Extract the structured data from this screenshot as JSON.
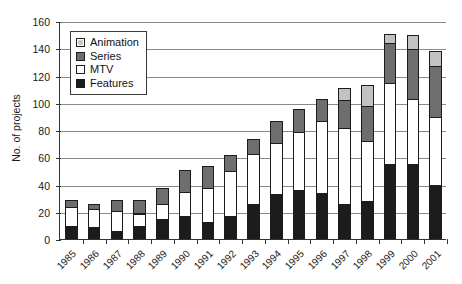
{
  "chart_data": {
    "type": "bar",
    "stacked": true,
    "title": "",
    "subtitle": "",
    "xlabel": "",
    "ylabel": "No. of projects",
    "ylim": [
      0,
      160
    ],
    "ytick_step": 20,
    "yticks": [
      0,
      20,
      40,
      60,
      80,
      100,
      120,
      140,
      160
    ],
    "grid": "horizontal",
    "legend_position": "top-left-inside",
    "categories": [
      "1985",
      "1986",
      "1987",
      "1988",
      "1989",
      "1990",
      "1991",
      "1992",
      "1993",
      "1994",
      "1995",
      "1996",
      "1997",
      "1998",
      "1999",
      "2000",
      "2001"
    ],
    "series": [
      {
        "name": "Features",
        "color": "#1c1c1c",
        "values": [
          9,
          8,
          5,
          9,
          14,
          16,
          12,
          16,
          25,
          32,
          35,
          33,
          25,
          27,
          54,
          54,
          39
        ]
      },
      {
        "name": "MTV",
        "color": "#ffffff",
        "values": [
          14,
          13,
          15,
          9,
          11,
          18,
          25,
          33,
          37,
          38,
          43,
          53,
          56,
          44,
          60,
          48,
          50
        ]
      },
      {
        "name": "Series",
        "color": "#6e6e6e",
        "values": [
          5,
          4,
          8,
          10,
          12,
          16,
          16,
          12,
          11,
          16,
          17,
          16,
          20,
          26,
          29,
          37,
          37
        ]
      },
      {
        "name": "Animation",
        "color": "#c2c2c2",
        "values": [
          0,
          0,
          0,
          0,
          0,
          0,
          0,
          0,
          0,
          0,
          0,
          0,
          9,
          15,
          7,
          10,
          11
        ]
      }
    ],
    "totals": [
      28,
      25,
      28,
      28,
      37,
      50,
      53,
      61,
      73,
      86,
      95,
      102,
      110,
      112,
      150,
      149,
      137
    ]
  },
  "legend": {
    "items": [
      {
        "label": "Animation",
        "color": "#c2c2c2"
      },
      {
        "label": "Series",
        "color": "#6e6e6e"
      },
      {
        "label": "MTV",
        "color": "#ffffff"
      },
      {
        "label": "Features",
        "color": "#1c1c1c"
      }
    ]
  },
  "axis": {
    "y_title": "No. of projects"
  }
}
